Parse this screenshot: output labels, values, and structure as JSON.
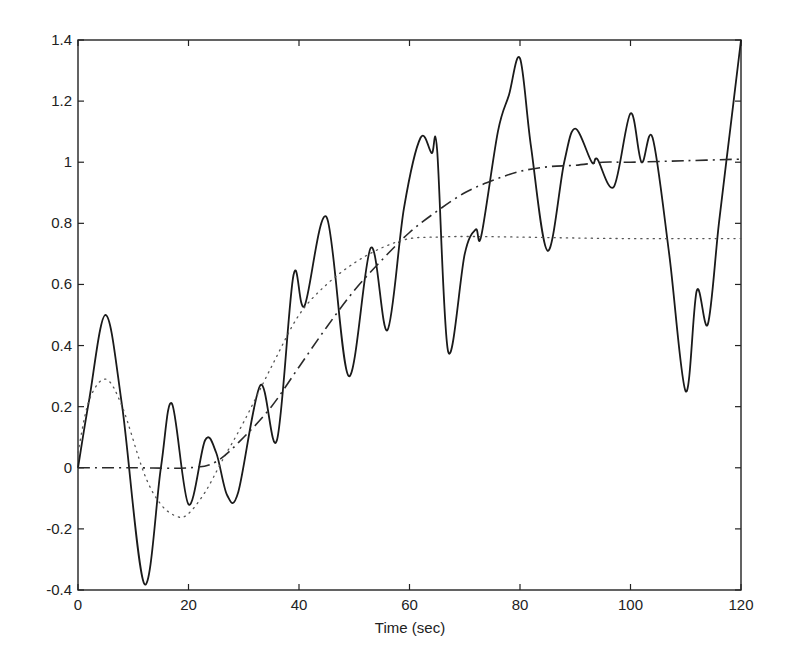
{
  "chart_data": {
    "type": "line",
    "title": "",
    "xlabel": "Time (sec)",
    "ylabel": "",
    "xlim": [
      0,
      120
    ],
    "ylim": [
      -0.4,
      1.4
    ],
    "grid": false,
    "legend": null,
    "xticks": [
      0,
      20,
      40,
      60,
      80,
      100,
      120
    ],
    "xtick_labels": [
      "0",
      "20",
      "40",
      "60",
      "80",
      "100",
      "120"
    ],
    "yticks": [
      -0.4,
      -0.2,
      0,
      0.2,
      0.4,
      0.6,
      0.8,
      1,
      1.2,
      1.4
    ],
    "ytick_labels": [
      "-0.4",
      "-0.2",
      "0",
      "0.2",
      "0.4",
      "0.6",
      "0.8",
      "1",
      "1.2",
      "1.4"
    ],
    "series": [
      {
        "name": "solid",
        "style": "solid",
        "x": [
          0,
          2,
          5,
          8,
          12,
          15,
          17,
          20,
          23,
          25,
          27,
          29,
          33,
          36,
          39,
          41,
          45,
          49,
          53,
          56,
          59,
          62,
          64,
          65,
          67,
          70,
          72,
          73,
          76,
          78,
          80,
          82,
          85,
          88,
          90,
          93,
          94,
          97,
          100,
          102,
          104,
          107,
          110,
          112,
          114,
          116,
          118,
          120
        ],
        "y": [
          0,
          0.22,
          0.5,
          0.2,
          -0.38,
          0.0,
          0.21,
          -0.12,
          0.09,
          0.05,
          -0.09,
          -0.08,
          0.27,
          0.09,
          0.63,
          0.53,
          0.82,
          0.3,
          0.72,
          0.45,
          0.85,
          1.08,
          1.03,
          1.04,
          0.38,
          0.7,
          0.78,
          0.76,
          1.1,
          1.22,
          1.34,
          1.05,
          0.71,
          1.0,
          1.11,
          1.0,
          1.01,
          0.92,
          1.16,
          1.0,
          1.08,
          0.7,
          0.25,
          0.58,
          0.47,
          0.8,
          1.1,
          1.4
        ]
      },
      {
        "name": "dotted",
        "style": "dotted",
        "x": [
          0,
          2,
          5,
          8,
          12,
          15,
          18,
          20,
          23,
          26,
          30,
          35,
          40,
          45,
          50,
          55,
          60,
          65,
          70,
          80,
          90,
          100,
          110,
          120
        ],
        "y": [
          0.05,
          0.22,
          0.29,
          0.2,
          -0.02,
          -0.12,
          -0.16,
          -0.15,
          -0.08,
          0.02,
          0.15,
          0.33,
          0.5,
          0.6,
          0.67,
          0.72,
          0.75,
          0.755,
          0.757,
          0.755,
          0.752,
          0.75,
          0.75,
          0.75
        ]
      },
      {
        "name": "dash-dot",
        "style": "dashdot",
        "x": [
          0,
          10,
          20,
          25,
          30,
          35,
          40,
          45,
          50,
          55,
          60,
          65,
          70,
          75,
          80,
          85,
          90,
          95,
          100,
          110,
          120
        ],
        "y": [
          0,
          0,
          0.0,
          0.02,
          0.1,
          0.2,
          0.33,
          0.46,
          0.58,
          0.68,
          0.77,
          0.84,
          0.9,
          0.94,
          0.97,
          0.985,
          0.99,
          1.0,
          1.0,
          1.005,
          1.01
        ]
      }
    ]
  },
  "axes": {
    "xlabel": "Time (sec)"
  }
}
